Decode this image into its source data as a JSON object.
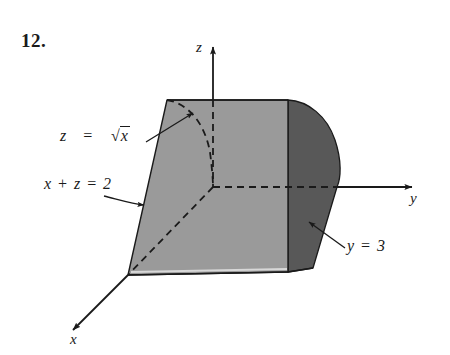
{
  "figure": {
    "problem_number": "12.",
    "axes": [
      {
        "name": "z",
        "label": "z"
      },
      {
        "name": "y",
        "label": "y"
      },
      {
        "name": "x",
        "label": "x"
      }
    ],
    "annotations": [
      {
        "name": "surface-curve",
        "lhs": "z",
        "eq": "=",
        "radical": "√",
        "radicand": "x",
        "full": "z = √x"
      },
      {
        "name": "slanted-plane",
        "full": "x + z = 2"
      },
      {
        "name": "back-plane",
        "full": "y = 3"
      }
    ],
    "colors": {
      "front_face": "#9a9a9a",
      "right_face": "#585858",
      "bottom_face": "#b4b4b4",
      "outline": "#1a1a1a",
      "background": "#ffffff"
    },
    "caption_parts": {
      "z_eq": "z",
      "eq_sign": "=",
      "radicand": "x",
      "x_plus_z_eq_2": "x + z = 2",
      "y_eq_3": "y = 3"
    }
  }
}
